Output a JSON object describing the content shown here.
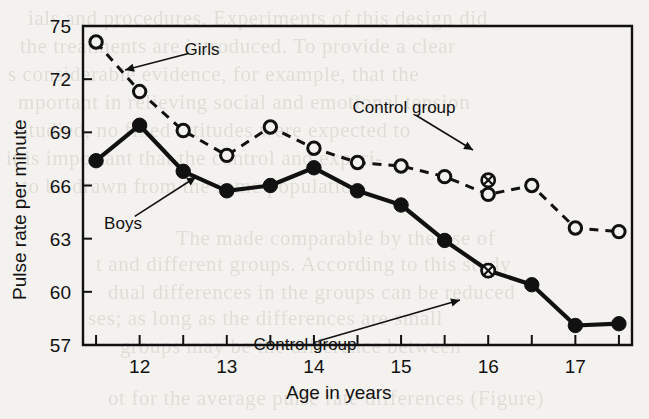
{
  "figure": {
    "background_color": "#f4f2ee",
    "ink_color": "#111111"
  },
  "chart_data": {
    "type": "line",
    "title": "",
    "xlabel": "Age in years",
    "ylabel": "Pulse rate per minute",
    "xlim": [
      11.35,
      17.65
    ],
    "ylim": [
      57,
      75
    ],
    "grid": false,
    "legend": "inline-annotations",
    "x": [
      11.5,
      12.0,
      12.5,
      13.0,
      13.5,
      14.0,
      14.5,
      15.0,
      15.5,
      16.0,
      16.5,
      17.0,
      17.5
    ],
    "xticks": [
      11.5,
      12.0,
      12.5,
      13.0,
      13.5,
      14.0,
      14.5,
      15.0,
      15.5,
      16.0,
      16.5,
      17.0,
      17.5
    ],
    "xticklabels": [
      "",
      "12",
      "",
      "13",
      "",
      "14",
      "",
      "15",
      "",
      "16",
      "",
      "17",
      ""
    ],
    "yticks": [
      57,
      60,
      63,
      66,
      69,
      72,
      75
    ],
    "yticklabels": [
      "57",
      "60",
      "63",
      "66",
      "69",
      "72",
      "75"
    ],
    "series": [
      {
        "name": "Girls",
        "marker": "open-circle",
        "linestyle": "dashed",
        "values": [
          74.1,
          71.3,
          69.1,
          67.7,
          69.3,
          68.1,
          67.3,
          67.1,
          66.5,
          65.5,
          66.0,
          63.6,
          63.4
        ]
      },
      {
        "name": "Boys",
        "marker": "filled-circle",
        "linestyle": "solid",
        "values": [
          67.4,
          69.4,
          66.8,
          65.7,
          66.0,
          67.0,
          65.7,
          64.9,
          62.9,
          61.2,
          60.4,
          58.1,
          58.2
        ]
      }
    ],
    "annotations": [
      {
        "id": "girls",
        "text": "Girls",
        "label_x": 202,
        "label_y": 50,
        "tip_x": 125,
        "tip_y": 70
      },
      {
        "id": "boys",
        "text": "Boys",
        "label_x": 123,
        "label_y": 224,
        "tip_x": 196,
        "tip_y": 177
      },
      {
        "id": "control-girls",
        "text": "Control group",
        "label_x": 404,
        "label_y": 108,
        "tip_x": 473,
        "tip_y": 150
      },
      {
        "id": "control-boys",
        "text": "Control group",
        "label_x": 305,
        "label_y": 345,
        "tip_x": 460,
        "tip_y": 300
      }
    ],
    "control_points": [
      {
        "series": "Girls",
        "x": 16.0,
        "y": 66.3,
        "marker": "crossed-circle"
      },
      {
        "series": "Boys",
        "x": 16.0,
        "y": 61.2,
        "marker": "crossed-circle"
      }
    ]
  },
  "ghost_text": [
    {
      "text": "ials and procedures. Experiments of this design did",
      "x": 28,
      "y": 6
    },
    {
      "text": "the treatments are introduced. To provide a clear",
      "x": 20,
      "y": 34
    },
    {
      "text": "s considerable evidence, for example, that the",
      "x": 8,
      "y": 62
    },
    {
      "text": "mportant in relieving social and emotional tension",
      "x": 18,
      "y": 90
    },
    {
      "text": "studied, no fixed attitudes were expected to",
      "x": 20,
      "y": 118
    },
    {
      "text": "it is important that the control and experi-",
      "x": 6,
      "y": 146
    },
    {
      "text": "to be drawn from the same population",
      "x": 22,
      "y": 174
    },
    {
      "text": "The made comparable by the use of",
      "x": 176,
      "y": 226
    },
    {
      "text": "t and different groups. According to this study",
      "x": 96,
      "y": 252
    },
    {
      "text": "dual differences in the groups can be reduced",
      "x": 108,
      "y": 280
    },
    {
      "text": "ses; as long as the differences are small",
      "x": 88,
      "y": 306
    },
    {
      "text": "groups may be the difference between",
      "x": 120,
      "y": 334
    },
    {
      "text": "ot for the average pulse rate differences (Figure)",
      "x": 108,
      "y": 386
    }
  ]
}
